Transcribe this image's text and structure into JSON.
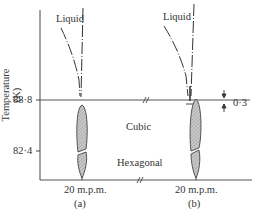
{
  "figure": {
    "y_axis_label": "Temperature (K)",
    "y_ticks": [
      {
        "label": "88·8",
        "value": 88.8
      },
      {
        "label": "82·4",
        "value": 82.4
      }
    ],
    "regions": {
      "liquid_a": "Liquid",
      "liquid_b": "Liquid",
      "cubic": "Cubic",
      "hexagonal": "Hexagonal"
    },
    "annotation": {
      "gap_label": "0·3"
    },
    "panels": [
      {
        "x_label": "20 m.p.m.",
        "caption": "(a)"
      },
      {
        "x_label": "20 m.p.m.",
        "caption": "(b)"
      }
    ],
    "break_mark": "//",
    "colors": {
      "line": "#333333",
      "hatch_fill": "#bdbdbd"
    }
  }
}
